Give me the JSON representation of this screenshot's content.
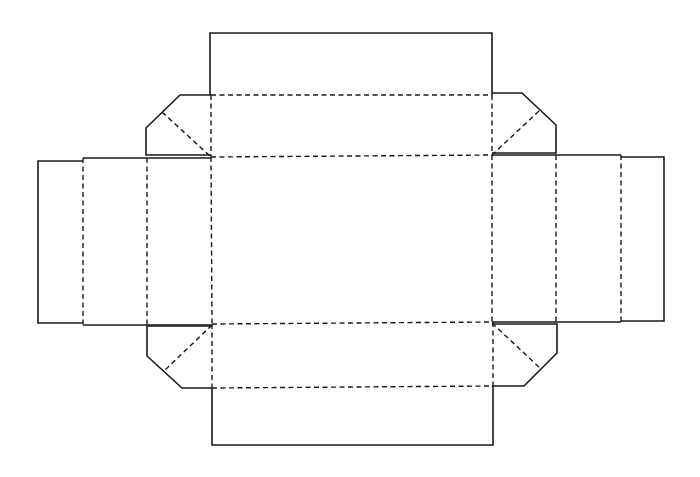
{
  "diagram": {
    "type": "box-dieline",
    "colors": {
      "background": "#ffffff",
      "line": "#1a1a1a"
    },
    "line_styles": {
      "cut": "solid",
      "fold": "dashed"
    },
    "panels": [
      {
        "name": "base",
        "x": 211,
        "y": 157,
        "w": 282,
        "h": 167
      },
      {
        "name": "top-side-panel",
        "x": 211,
        "y": 95,
        "w": 282,
        "h": 62
      },
      {
        "name": "top-tuck-flap",
        "x": 210,
        "y": 33,
        "w": 282,
        "h": 62
      },
      {
        "name": "bottom-side-panel",
        "x": 212,
        "y": 324,
        "w": 281,
        "h": 64
      },
      {
        "name": "bottom-tuck-flap",
        "x": 212,
        "y": 388,
        "w": 281,
        "h": 57
      },
      {
        "name": "left-side-panel",
        "x": 83,
        "y": 158,
        "w": 64,
        "h": 167
      },
      {
        "name": "left-end-flap",
        "x": 38,
        "y": 161,
        "w": 45,
        "h": 162
      },
      {
        "name": "right-side-panel",
        "x": 556,
        "y": 155,
        "w": 65,
        "h": 167
      },
      {
        "name": "right-end-flap",
        "x": 621,
        "y": 157,
        "w": 43,
        "h": 164
      }
    ],
    "corner_flaps": [
      {
        "name": "top-left-corner-flap"
      },
      {
        "name": "top-right-corner-flap"
      },
      {
        "name": "bottom-left-corner-flap"
      },
      {
        "name": "bottom-right-corner-flap"
      }
    ]
  }
}
